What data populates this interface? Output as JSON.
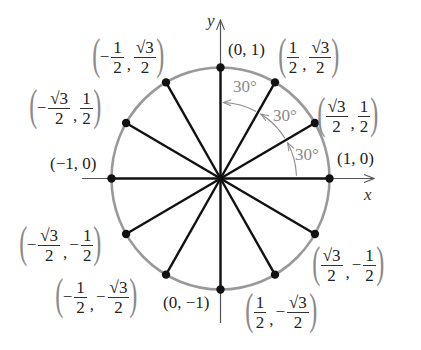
{
  "diagram": {
    "axes": {
      "x_label": "x",
      "y_label": "y"
    },
    "geometry": {
      "cx": 220.5,
      "cy": 178.5,
      "rx": 109,
      "ry": 111,
      "x_axis": [
        82,
        374
      ],
      "y_axis": [
        20,
        323
      ]
    },
    "colors": {
      "circle": "#999999",
      "axis": "#555555",
      "radius_line": "#111111",
      "point": "#111111",
      "angle_arc": "#8a8a8a"
    },
    "angle_labels": [
      "30°",
      "30°",
      "30°"
    ],
    "points": [
      {
        "angle": 0,
        "label": "(1, 0)"
      },
      {
        "angle": 30,
        "x_num": "√3",
        "x_den": "2",
        "y_num": "1",
        "y_den": "2"
      },
      {
        "angle": 60,
        "x_num": "1",
        "x_den": "2",
        "y_num": "√3",
        "y_den": "2"
      },
      {
        "angle": 90,
        "label": "(0, 1)"
      },
      {
        "angle": 120,
        "x_sign": "−",
        "x_num": "1",
        "x_den": "2",
        "y_num": "√3",
        "y_den": "2"
      },
      {
        "angle": 150,
        "x_sign": "−",
        "x_num": "√3",
        "x_den": "2",
        "y_num": "1",
        "y_den": "2"
      },
      {
        "angle": 180,
        "label": "(−1, 0)"
      },
      {
        "angle": 210,
        "x_sign": "−",
        "x_num": "√3",
        "x_den": "2",
        "y_sign": "−",
        "y_num": "1",
        "y_den": "2"
      },
      {
        "angle": 240,
        "x_sign": "−",
        "x_num": "1",
        "x_den": "2",
        "y_sign": "−",
        "y_num": "√3",
        "y_den": "2"
      },
      {
        "angle": 270,
        "label": "(0, −1)"
      },
      {
        "angle": 300,
        "x_num": "1",
        "x_den": "2",
        "y_sign": "−",
        "y_num": "√3",
        "y_den": "2"
      },
      {
        "angle": 330,
        "x_num": "√3",
        "x_den": "2",
        "y_sign": "−",
        "y_num": "1",
        "y_den": "2"
      }
    ]
  }
}
